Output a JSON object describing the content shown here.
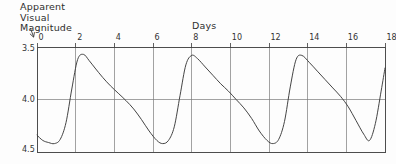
{
  "figure": {
    "y_axis_title": "Apparent\nVisual\nMagnitude",
    "x_axis_title": "Days",
    "arrow_icon": "down-arrow-icon",
    "ink_color": "#3a3a3a",
    "grid_color": "#7a7a7a",
    "background_color": "#fdfdfd"
  },
  "chart_data": {
    "type": "line",
    "title": "",
    "subtitle": "",
    "xlabel": "Days",
    "ylabel": "Apparent Visual Magnitude",
    "xlim": [
      0,
      18
    ],
    "ylim": [
      3.5,
      4.5
    ],
    "y_inverted": true,
    "grid": true,
    "legend": null,
    "xticks": [
      0,
      2,
      4,
      6,
      8,
      10,
      12,
      14,
      16,
      18
    ],
    "xtick_labels": [
      "0",
      "2",
      "4",
      "6",
      "8",
      "10",
      "12",
      "14",
      "16",
      "18"
    ],
    "yticks": [
      3.5,
      4.0,
      4.5
    ],
    "ytick_labels": [
      "3.5",
      "4.0",
      "4.5"
    ],
    "annotations": [],
    "series": [
      {
        "name": "Light curve",
        "period_days": 5.4,
        "max_magnitude": 3.57,
        "min_magnitude": 4.42,
        "x": [
          0.0,
          0.3,
          0.6,
          0.9,
          1.2,
          1.5,
          1.8,
          2.1,
          2.4,
          2.7,
          3.0,
          3.4,
          3.8,
          4.2,
          4.6,
          5.0,
          5.4,
          5.8,
          6.2,
          6.5,
          6.8,
          7.1,
          7.4,
          7.7,
          8.0,
          8.3,
          8.7,
          9.1,
          9.5,
          9.9,
          10.3,
          10.7,
          11.1,
          11.5,
          11.9,
          12.2,
          12.5,
          12.8,
          13.1,
          13.4,
          13.7,
          14.1,
          14.5,
          14.9,
          15.3,
          15.7,
          16.1,
          16.5,
          16.9,
          17.2,
          17.5,
          17.8,
          18.0
        ],
        "y": [
          4.34,
          4.39,
          4.41,
          4.42,
          4.38,
          4.22,
          3.9,
          3.62,
          3.57,
          3.63,
          3.7,
          3.79,
          3.87,
          3.94,
          4.01,
          4.09,
          4.19,
          4.3,
          4.39,
          4.42,
          4.39,
          4.26,
          3.96,
          3.67,
          3.58,
          3.61,
          3.69,
          3.77,
          3.85,
          3.92,
          4.0,
          4.08,
          4.18,
          4.3,
          4.39,
          4.42,
          4.38,
          4.21,
          3.88,
          3.62,
          3.58,
          3.65,
          3.73,
          3.81,
          3.89,
          3.97,
          4.07,
          4.2,
          4.33,
          4.39,
          4.23,
          3.92,
          3.7
        ]
      }
    ]
  },
  "geometry": {
    "plot_left": 37,
    "plot_right": 385,
    "plot_top": 47,
    "plot_bottom": 152
  }
}
